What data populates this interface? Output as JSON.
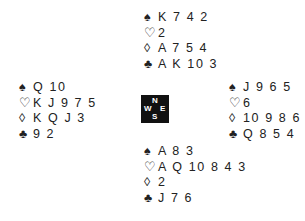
{
  "hands": {
    "north": {
      "spades": {
        "symbol": "♠",
        "cards": "K 7 4 2"
      },
      "hearts": {
        "symbol": "♡",
        "cards": "2"
      },
      "diamonds": {
        "symbol": "◊",
        "cards": "A 7 5 4"
      },
      "clubs": {
        "symbol": "♣",
        "cards": "A K 10 3"
      }
    },
    "west": {
      "spades": {
        "symbol": "♠",
        "cards": "Q 10"
      },
      "hearts": {
        "symbol": "♡",
        "cards": "K J 9 7 5"
      },
      "diamonds": {
        "symbol": "◊",
        "cards": "K Q J 3"
      },
      "clubs": {
        "symbol": "♣",
        "cards": "9 2"
      }
    },
    "east": {
      "spades": {
        "symbol": "♠",
        "cards": "J 9 6 5"
      },
      "hearts": {
        "symbol": "♡",
        "cards": "6"
      },
      "diamonds": {
        "symbol": "◊",
        "cards": "10 9 8 6"
      },
      "clubs": {
        "symbol": "♣",
        "cards": "Q 8 5 4"
      }
    },
    "south": {
      "spades": {
        "symbol": "♠",
        "cards": "A 8 3"
      },
      "hearts": {
        "symbol": "♡",
        "cards": "A Q 10 8 4 3"
      },
      "diamonds": {
        "symbol": "◊",
        "cards": "2"
      },
      "clubs": {
        "symbol": "♣",
        "cards": "J 7 6"
      }
    }
  },
  "compass": {
    "n": "N",
    "s": "S",
    "w": "W",
    "e": "E"
  }
}
